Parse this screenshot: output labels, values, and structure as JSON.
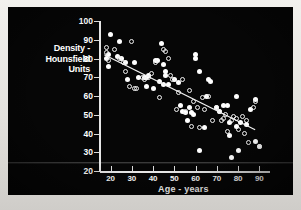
{
  "figure": {
    "background_color": "#060606",
    "mark_color": "#ffffff",
    "frame_color": "#e3e1dd"
  },
  "chart_data": {
    "type": "scatter",
    "title": "",
    "xlabel": "Age - years",
    "ylabel": "Density - Hounsfield Units",
    "xlim": [
      15,
      95
    ],
    "ylim": [
      20,
      100
    ],
    "xticks": [
      20,
      30,
      40,
      50,
      60,
      70,
      80,
      90
    ],
    "yticks": [
      20,
      30,
      40,
      50,
      60,
      70,
      80,
      90,
      100
    ],
    "grid": false,
    "legend": "none",
    "series": [
      {
        "name": "filled-circles",
        "marker": "filled circle",
        "points": [
          [
            20,
            93
          ],
          [
            19,
            82
          ],
          [
            18,
            80
          ],
          [
            19,
            76
          ],
          [
            24,
            89
          ],
          [
            23,
            81
          ],
          [
            25,
            80
          ],
          [
            27,
            78
          ],
          [
            28,
            69
          ],
          [
            31,
            78
          ],
          [
            33,
            70
          ],
          [
            36,
            70
          ],
          [
            37,
            70
          ],
          [
            38,
            71
          ],
          [
            37,
            65
          ],
          [
            40,
            64
          ],
          [
            41,
            79
          ],
          [
            42,
            79
          ],
          [
            43,
            68
          ],
          [
            44,
            88
          ],
          [
            45,
            77
          ],
          [
            46,
            73
          ],
          [
            46,
            71
          ],
          [
            45,
            66
          ],
          [
            47,
            66
          ],
          [
            50,
            69
          ],
          [
            52,
            67
          ],
          [
            53,
            55
          ],
          [
            54,
            52
          ],
          [
            55,
            51
          ],
          [
            56,
            47
          ],
          [
            57,
            54
          ],
          [
            58,
            51
          ],
          [
            59,
            50
          ],
          [
            60,
            82
          ],
          [
            60,
            80
          ],
          [
            62,
            73
          ],
          [
            62,
            31
          ],
          [
            64,
            43
          ],
          [
            65,
            60
          ],
          [
            66,
            69
          ],
          [
            67,
            68
          ],
          [
            70,
            54
          ],
          [
            71,
            52
          ],
          [
            73,
            55
          ],
          [
            75,
            55
          ],
          [
            76,
            46
          ],
          [
            76,
            39
          ],
          [
            77,
            27
          ],
          [
            79,
            60
          ],
          [
            79,
            44
          ],
          [
            80,
            31
          ],
          [
            81,
            46
          ],
          [
            84,
            45
          ],
          [
            86,
            53
          ],
          [
            88,
            58
          ],
          [
            88,
            36
          ],
          [
            90,
            33
          ]
        ]
      },
      {
        "name": "open-circles",
        "marker": "open circle",
        "points": [
          [
            18,
            86
          ],
          [
            18,
            83
          ],
          [
            19,
            79
          ],
          [
            22,
            85
          ],
          [
            24,
            80
          ],
          [
            26,
            78
          ],
          [
            27,
            73
          ],
          [
            29,
            65
          ],
          [
            30,
            89
          ],
          [
            31,
            64
          ],
          [
            32,
            64
          ],
          [
            35,
            70
          ],
          [
            36,
            69
          ],
          [
            38,
            70
          ],
          [
            39,
            72
          ],
          [
            41,
            78
          ],
          [
            43,
            59
          ],
          [
            45,
            85
          ],
          [
            46,
            84
          ],
          [
            47,
            80
          ],
          [
            48,
            71
          ],
          [
            49,
            69
          ],
          [
            51,
            53
          ],
          [
            52,
            62
          ],
          [
            54,
            69
          ],
          [
            55,
            52
          ],
          [
            57,
            63
          ],
          [
            58,
            44
          ],
          [
            59,
            57
          ],
          [
            61,
            54
          ],
          [
            62,
            43
          ],
          [
            63,
            59
          ],
          [
            64,
            53
          ],
          [
            66,
            60
          ],
          [
            68,
            47
          ],
          [
            70,
            54
          ],
          [
            71,
            52
          ],
          [
            72,
            47
          ],
          [
            73,
            48
          ],
          [
            74,
            50
          ],
          [
            75,
            41
          ],
          [
            77,
            47
          ],
          [
            78,
            49
          ],
          [
            79,
            48
          ],
          [
            80,
            42
          ],
          [
            82,
            49
          ],
          [
            83,
            40
          ],
          [
            84,
            47
          ],
          [
            85,
            35
          ],
          [
            87,
            54
          ],
          [
            88,
            57
          ],
          [
            90,
            33
          ]
        ]
      }
    ],
    "regression_line": {
      "x": [
        17,
        88
      ],
      "y": [
        82,
        42
      ]
    }
  },
  "axis": {
    "x_ticklabels": [
      "20",
      "30",
      "40",
      "50",
      "60",
      "70",
      "80",
      "90"
    ],
    "y_ticklabels": [
      "20",
      "30",
      "40",
      "50",
      "60",
      "70",
      "80",
      "90",
      "100"
    ],
    "x_title": "Age - years",
    "y_title_line1": "Density -",
    "y_title_line2": "Hounsfield",
    "y_title_line3": "Units"
  }
}
